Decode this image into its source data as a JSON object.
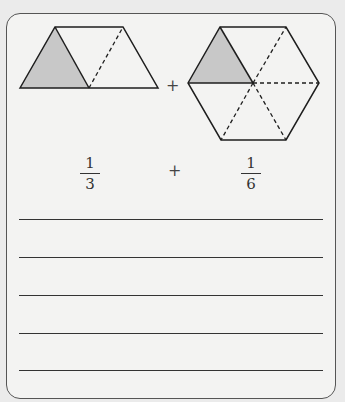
{
  "colors": {
    "shade": "#c8c8c8",
    "stroke": "#1e1e1e"
  },
  "figures": {
    "left_shape": "trapezoid split into 3 triangles, 1 shaded",
    "right_shape": "hexagon split into 6 triangles, 1 shaded",
    "operator_top": "+"
  },
  "expression": {
    "left": {
      "numerator": "1",
      "denominator": "3"
    },
    "operator": "+",
    "right": {
      "numerator": "1",
      "denominator": "6"
    }
  },
  "answer_lines": 5
}
